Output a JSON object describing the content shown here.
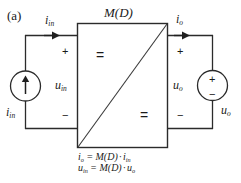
{
  "figure": {
    "panel_label": "(a)",
    "block_label": "M(D)",
    "caption_lines": [
      "iₒ = M(D)·iᵢₙ",
      "uᵢₙ = M(D)·uₒ"
    ]
  },
  "equations": {
    "line1": {
      "lhs_symbol": "i",
      "lhs_sub": "o",
      "equals": "=",
      "gain": "M(D)",
      "dot": "·",
      "rhs_symbol": "i",
      "rhs_sub": "in"
    },
    "line2": {
      "lhs_symbol": "u",
      "lhs_sub": "in",
      "equals": "=",
      "gain": "M(D)",
      "dot": "·",
      "rhs_symbol": "u",
      "rhs_sub": "o"
    }
  },
  "labels": {
    "input_current_arrow": {
      "symbol": "i",
      "sub": "in"
    },
    "output_current_arrow": {
      "symbol": "i",
      "sub": "o"
    },
    "input_voltage": {
      "symbol": "u",
      "sub": "in"
    },
    "output_voltage": {
      "symbol": "u",
      "sub": "o"
    },
    "source_left": {
      "symbol": "i",
      "sub": "in"
    },
    "source_right": {
      "symbol": "u",
      "sub": "o"
    }
  },
  "polarity": {
    "input_plus": "+",
    "input_minus": "−",
    "output_plus": "+",
    "output_minus": "−",
    "vsource_plus": "+",
    "vsource_minus": "−"
  },
  "block": {
    "top_equals": "=",
    "bottom_equals": "="
  },
  "colors": {
    "stroke": "#2b2b2b",
    "diagonal": "#3a3a3a",
    "text": "#1a1a1a",
    "background": "#ffffff"
  }
}
